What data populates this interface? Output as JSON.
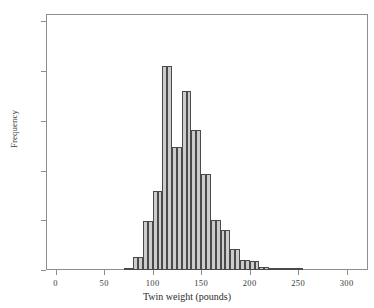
{
  "chart_data": {
    "type": "bar",
    "title": "",
    "subtitle": "",
    "xlabel": "Twin weight (pounds)",
    "ylabel": "Frequency",
    "grid": false,
    "legend": "none",
    "xlim": [
      -10,
      322
    ],
    "ylim": [
      0,
      515
    ],
    "bin_width": 5,
    "xticks": [
      0,
      50,
      100,
      150,
      200,
      250,
      300
    ],
    "xtick_labels": [
      "0",
      "50",
      "100",
      "150",
      "200",
      "250",
      "300"
    ],
    "yticks": [
      0,
      100,
      200,
      300,
      400,
      500
    ],
    "ytick_labels": [
      "0",
      "100",
      "200",
      "300",
      "400",
      "500"
    ],
    "bar_fill_color": "#cccccc",
    "bar_edge_color": "#4a4a4a",
    "axis_color": "#8e8e8e",
    "background_color": "#ffffff",
    "bins": [
      {
        "x0": 70,
        "x1": 75,
        "value": 3
      },
      {
        "x0": 75,
        "x1": 80,
        "value": 5
      },
      {
        "x0": 80,
        "x1": 85,
        "value": 27
      },
      {
        "x0": 85,
        "x1": 90,
        "value": 27
      },
      {
        "x0": 90,
        "x1": 95,
        "value": 99
      },
      {
        "x0": 95,
        "x1": 100,
        "value": 99
      },
      {
        "x0": 100,
        "x1": 105,
        "value": 158
      },
      {
        "x0": 105,
        "x1": 110,
        "value": 158
      },
      {
        "x0": 110,
        "x1": 115,
        "value": 410
      },
      {
        "x0": 115,
        "x1": 120,
        "value": 410
      },
      {
        "x0": 120,
        "x1": 125,
        "value": 248
      },
      {
        "x0": 125,
        "x1": 130,
        "value": 248
      },
      {
        "x0": 130,
        "x1": 135,
        "value": 360
      },
      {
        "x0": 135,
        "x1": 140,
        "value": 360
      },
      {
        "x0": 140,
        "x1": 145,
        "value": 282
      },
      {
        "x0": 145,
        "x1": 150,
        "value": 282
      },
      {
        "x0": 150,
        "x1": 155,
        "value": 194
      },
      {
        "x0": 155,
        "x1": 160,
        "value": 194
      },
      {
        "x0": 160,
        "x1": 165,
        "value": 101
      },
      {
        "x0": 165,
        "x1": 170,
        "value": 101
      },
      {
        "x0": 170,
        "x1": 175,
        "value": 80
      },
      {
        "x0": 175,
        "x1": 180,
        "value": 80
      },
      {
        "x0": 180,
        "x1": 185,
        "value": 43
      },
      {
        "x0": 185,
        "x1": 190,
        "value": 43
      },
      {
        "x0": 190,
        "x1": 195,
        "value": 20
      },
      {
        "x0": 195,
        "x1": 200,
        "value": 20
      },
      {
        "x0": 200,
        "x1": 205,
        "value": 18
      },
      {
        "x0": 205,
        "x1": 210,
        "value": 18
      },
      {
        "x0": 210,
        "x1": 215,
        "value": 6
      },
      {
        "x0": 215,
        "x1": 220,
        "value": 6
      },
      {
        "x0": 220,
        "x1": 225,
        "value": 4
      },
      {
        "x0": 225,
        "x1": 230,
        "value": 4
      },
      {
        "x0": 230,
        "x1": 235,
        "value": 3
      },
      {
        "x0": 235,
        "x1": 240,
        "value": 3
      },
      {
        "x0": 240,
        "x1": 245,
        "value": 2
      },
      {
        "x0": 245,
        "x1": 250,
        "value": 2
      },
      {
        "x0": 250,
        "x1": 255,
        "value": 2
      }
    ]
  }
}
